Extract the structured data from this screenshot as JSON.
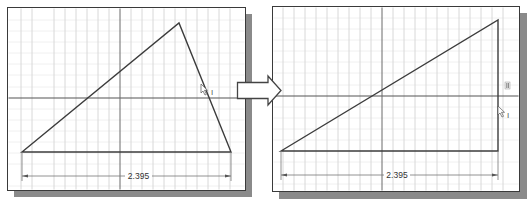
{
  "figure": {
    "colors": {
      "background": "#ffffff",
      "frame": "#3a3a3a",
      "shadow": "#8a8a8a",
      "grid_minor": "#e6e6e6",
      "grid_major": "#c8c8c8",
      "axis": "#5a5a5a",
      "geometry": "#3c3c3c",
      "dimension": "#6a6a6a"
    }
  },
  "left_panel": {
    "label": "before",
    "dimension_value": "2.395",
    "cursor_icon": "arrow-cursor-with-vertical-constraint",
    "cursor_glyph": "I",
    "triangle": {
      "p1": [
        22,
        152
      ],
      "p2": [
        179,
        23
      ],
      "p3": [
        231,
        152
      ]
    }
  },
  "transition_arrow": {
    "icon": "right-block-arrow"
  },
  "right_panel": {
    "label": "after",
    "dimension_value": "2.395",
    "constraint_icon": "vertical-constraint-glyph",
    "constraint_glyph": "∥",
    "cursor_icon": "arrow-cursor-with-vertical-constraint",
    "cursor_glyph": "I",
    "triangle": {
      "p1": [
        281,
        151
      ],
      "p2": [
        498,
        20
      ],
      "p3": [
        498,
        151
      ]
    }
  }
}
